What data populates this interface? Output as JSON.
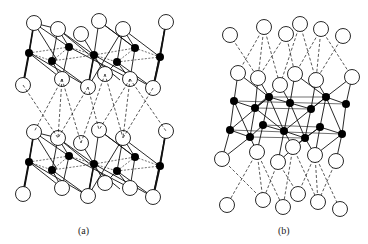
{
  "figure": {
    "panels": [
      {
        "label": "(a)",
        "description": "Two stacked octahedral layers with open circles (anions) and black dots (cations), connected between layers by dashed lines"
      },
      {
        "label": "(b)",
        "description": "Dense double layer of black-dot cations sandwiched between open-circle anion layers, with dashed connections above and below"
      }
    ],
    "legend_symbols": {
      "open_circle": "anion site",
      "filled_dot": "cation site",
      "solid_line": "bond",
      "dashed_line": "interlayer / hidden bond"
    },
    "colors": {
      "stroke": "#111111",
      "fill_dot": "#000000",
      "fill_circle": "#ffffff",
      "background": "#ffffff"
    }
  }
}
